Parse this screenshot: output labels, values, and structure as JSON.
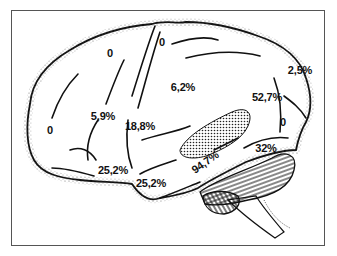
{
  "figure": {
    "colors": {
      "outline": "#111111",
      "stipple": "#333333",
      "frame": "#555555",
      "background": "#ffffff"
    },
    "regions": [
      {
        "id": "superior-frontal",
        "label": "0"
      },
      {
        "id": "precentral-top",
        "label": "0"
      },
      {
        "id": "postcentral",
        "label": "6,2%"
      },
      {
        "id": "parietal",
        "label": "2,5%"
      },
      {
        "id": "superior-temporal-upper",
        "label": "52,7%"
      },
      {
        "id": "middle-frontal",
        "label": "5,9%"
      },
      {
        "id": "precentral-lower",
        "label": "18,8%"
      },
      {
        "id": "frontal-pole",
        "label": "0"
      },
      {
        "id": "occipital",
        "label": "0"
      },
      {
        "id": "auditory-cortex",
        "label": "94,7%"
      },
      {
        "id": "temporal-posterior",
        "label": "32%"
      },
      {
        "id": "inferior-frontal",
        "label": "25,2%"
      },
      {
        "id": "temporal-pole",
        "label": "25,2%"
      }
    ]
  }
}
